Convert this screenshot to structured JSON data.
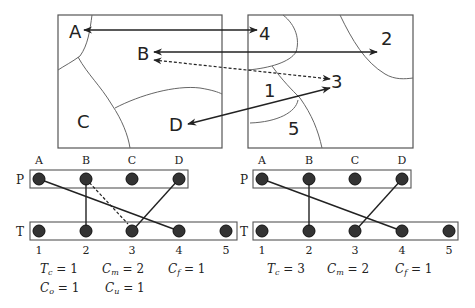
{
  "top_left_map": {
    "regions": [
      "A",
      "B",
      "C",
      "D"
    ]
  },
  "top_right_map": {
    "regions": [
      "4",
      "2",
      "3",
      "1",
      "5"
    ]
  },
  "arrows": [
    {
      "from": "4",
      "to": "A",
      "style": "solid"
    },
    {
      "from": "B",
      "to": "2",
      "style": "solid",
      "bidirectional": true
    },
    {
      "from": "3",
      "to": "B",
      "style": "dashed",
      "bidirectional": true
    },
    {
      "from": "D",
      "to": "3",
      "style": "solid",
      "bidirectional": true
    }
  ],
  "left_graph": {
    "row_p_label": "P",
    "row_t_label": "T",
    "p_nodes": [
      "A",
      "B",
      "C",
      "D"
    ],
    "t_nodes": [
      "1",
      "2",
      "3",
      "4",
      "5"
    ],
    "edges": [
      {
        "p": "A",
        "t": "4",
        "style": "solid"
      },
      {
        "p": "B",
        "t": "2",
        "style": "solid"
      },
      {
        "p": "B",
        "t": "3",
        "style": "dashed"
      },
      {
        "p": "D",
        "t": "3",
        "style": "solid"
      }
    ],
    "metrics": {
      "tc": {
        "symbol": "T",
        "sub": "c",
        "value": "1"
      },
      "cm": {
        "symbol": "C",
        "sub": "m",
        "value": "2"
      },
      "cf": {
        "symbol": "C",
        "sub": "f",
        "value": "1"
      },
      "co": {
        "symbol": "C",
        "sub": "o",
        "value": "1"
      },
      "cu": {
        "symbol": "C",
        "sub": "u",
        "value": "1"
      }
    }
  },
  "right_graph": {
    "row_p_label": "P",
    "row_t_label": "T",
    "p_nodes": [
      "A",
      "B",
      "C",
      "D"
    ],
    "t_nodes": [
      "1",
      "2",
      "3",
      "4",
      "5"
    ],
    "edges": [
      {
        "p": "A",
        "t": "4",
        "style": "solid"
      },
      {
        "p": "B",
        "t": "2",
        "style": "solid"
      },
      {
        "p": "D",
        "t": "3",
        "style": "solid"
      }
    ],
    "metrics": {
      "tc": {
        "symbol": "T",
        "sub": "c",
        "value": "3"
      },
      "cm": {
        "symbol": "C",
        "sub": "m",
        "value": "2"
      },
      "cf": {
        "symbol": "C",
        "sub": "f",
        "value": "1"
      }
    }
  },
  "colors": {
    "line": "#222222",
    "border": "#555555",
    "node_fill": "#333333",
    "node_stroke": "#111111"
  }
}
